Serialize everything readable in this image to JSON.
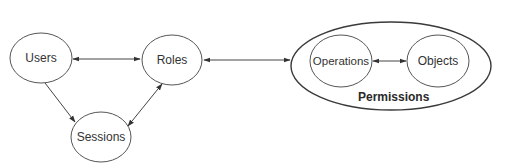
{
  "diagram": {
    "type": "RBAC model",
    "nodes": {
      "users": {
        "label": "Users",
        "cx": 41,
        "cy": 58,
        "rx": 31,
        "ry": 25
      },
      "roles": {
        "label": "Roles",
        "cx": 172,
        "cy": 60,
        "rx": 30,
        "ry": 25
      },
      "sessions": {
        "label": "Sessions",
        "cx": 101,
        "cy": 137,
        "rx": 30,
        "ry": 25
      },
      "operations": {
        "label": "Operations",
        "cx": 341,
        "cy": 61,
        "rx": 31,
        "ry": 26
      },
      "objects": {
        "label": "Objects",
        "cx": 438,
        "cy": 61,
        "rx": 31,
        "ry": 26
      }
    },
    "group": {
      "label": "Permissions",
      "cx": 391,
      "cy": 66,
      "rx": 100,
      "ry": 44,
      "contains": [
        "operations",
        "objects"
      ]
    },
    "edges": [
      {
        "from": "users",
        "to": "roles",
        "direction": "bidirectional"
      },
      {
        "from": "users",
        "to": "sessions",
        "direction": "to"
      },
      {
        "from": "sessions",
        "to": "roles",
        "direction": "bidirectional"
      },
      {
        "from": "roles",
        "to": "permissions",
        "direction": "bidirectional"
      },
      {
        "from": "operations",
        "to": "objects",
        "direction": "bidirectional"
      }
    ],
    "colors": {
      "stroke": "#555555",
      "text": "#333333",
      "background": "#ffffff"
    }
  }
}
